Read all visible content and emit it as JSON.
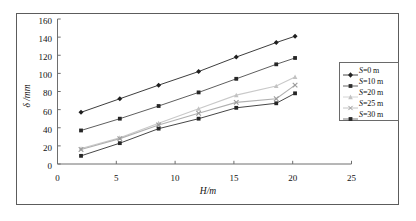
{
  "figure": {
    "xlabel": "H/m",
    "ylabel": "δ /mm"
  },
  "axes": {
    "x_ticks": [
      "0",
      "5",
      "10",
      "15",
      "20",
      "25"
    ],
    "y_ticks": [
      "0",
      "20",
      "40",
      "60",
      "80",
      "100",
      "120",
      "140",
      "160"
    ]
  },
  "legend": {
    "items": [
      {
        "label_prefix": "S",
        "label_rest": "=0 m",
        "full": "S=0 m",
        "marker": "diamond",
        "color": "#333333"
      },
      {
        "label_prefix": "S",
        "label_rest": "=10 m",
        "full": "S=10 m",
        "marker": "square",
        "color": "#555555"
      },
      {
        "label_prefix": "S",
        "label_rest": "=20 m",
        "full": "S=20 m",
        "marker": "triangle",
        "color": "#c9c9c9"
      },
      {
        "label_prefix": "S",
        "label_rest": "=25 m",
        "full": "S=25 m",
        "marker": "cross",
        "color": "#b0b0b0"
      },
      {
        "label_prefix": "S",
        "label_rest": "=30 m",
        "full": "S=30 m",
        "marker": "square",
        "color": "#3c3c3c"
      }
    ]
  },
  "chart_data": {
    "type": "line",
    "title": "",
    "xlabel": "H/m",
    "ylabel": "δ /mm",
    "xlim": [
      0,
      25
    ],
    "ylim": [
      0,
      160
    ],
    "xticks": [
      0,
      5,
      10,
      15,
      20,
      25
    ],
    "yticks": [
      0,
      20,
      40,
      60,
      80,
      100,
      120,
      140,
      160
    ],
    "grid": false,
    "legend_position": "right",
    "x": [
      2.0,
      5.3,
      8.6,
      12.0,
      15.2,
      18.6,
      20.2
    ],
    "series": [
      {
        "name": "S=0 m",
        "marker": "diamond",
        "color": "#333333",
        "values": [
          57,
          72,
          87,
          102,
          118,
          134,
          141
        ]
      },
      {
        "name": "S=10 m",
        "marker": "square",
        "color": "#555555",
        "values": [
          37,
          50,
          64,
          79,
          94,
          110,
          117
        ]
      },
      {
        "name": "S=20 m",
        "marker": "triangle",
        "color": "#c9c9c9",
        "values": [
          17,
          29,
          45,
          61,
          76,
          86,
          96
        ]
      },
      {
        "name": "S=25 m",
        "marker": "cross",
        "color": "#b0b0b0",
        "values": [
          16,
          28,
          43,
          56,
          68,
          72,
          87
        ]
      },
      {
        "name": "S=30 m",
        "marker": "square",
        "color": "#3c3c3c",
        "values": [
          9,
          23,
          39,
          50,
          62,
          67,
          78
        ]
      }
    ]
  }
}
